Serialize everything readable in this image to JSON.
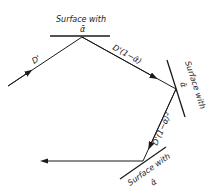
{
  "diagram": {
    "type": "multiple-reflection",
    "surfaces": [
      {
        "label_line1": "Surface with",
        "label_line2": "ᾱ"
      },
      {
        "label_line1": "Surface with",
        "label_line2": "ᾱ"
      },
      {
        "label_line1": "Surface with",
        "label_line2": "ᾱ"
      }
    ],
    "rays": [
      {
        "label": "D'"
      },
      {
        "label": "D'(1−ᾱ)"
      },
      {
        "label": "D'(1−ᾱ)²"
      },
      {
        "label": ""
      }
    ],
    "colors": {
      "line": "#1a1a1a",
      "background": "#ffffff"
    }
  }
}
